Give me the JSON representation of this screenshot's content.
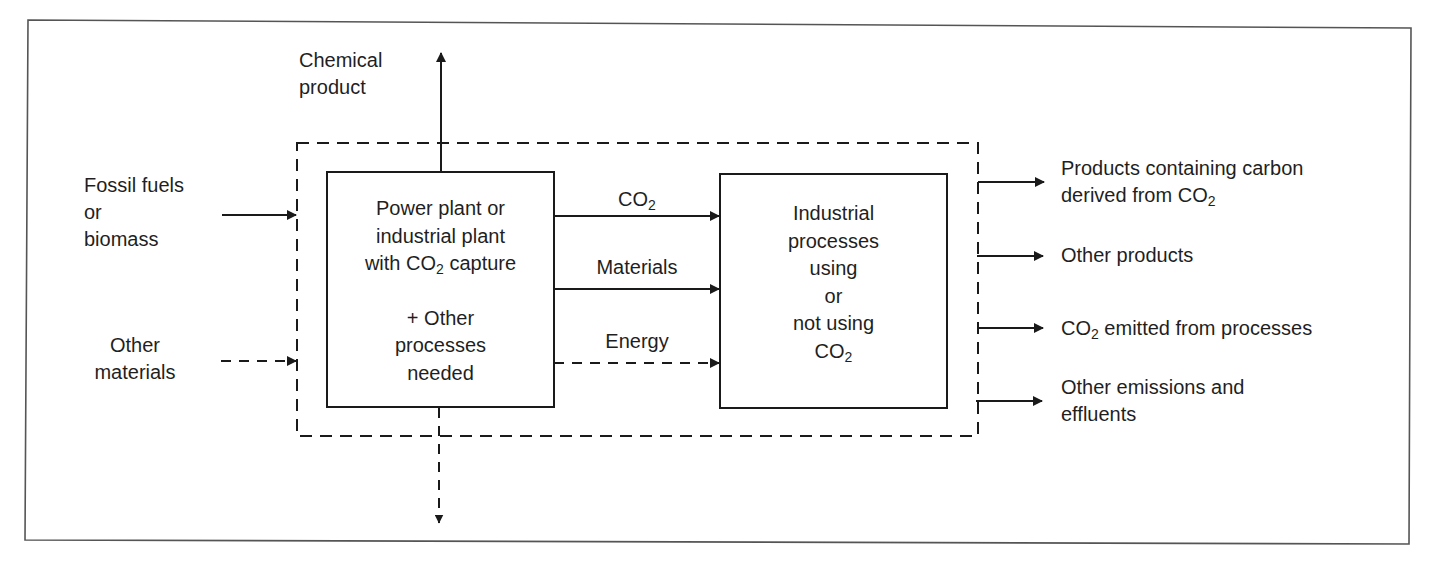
{
  "diagram": {
    "colors": {
      "stroke": "#1a1a1a",
      "frame": "#555555",
      "text": "#1f1f1f",
      "background": "#ffffff"
    },
    "inputs": {
      "fossil_fuels": [
        "Fossil fuels",
        "or",
        "biomass"
      ],
      "other_materials": [
        "Other",
        "materials"
      ]
    },
    "top_output": {
      "chemical_product": [
        "Chemical",
        "product"
      ]
    },
    "box_plant": {
      "line1": "Power plant or",
      "line2": "industrial plant",
      "line3_pre": "with CO",
      "line3_sub": "2",
      "line3_post": " capture",
      "line4": "+ Other",
      "line5": "processes",
      "line6": "needed"
    },
    "flows": {
      "co2_pre": "CO",
      "co2_sub": "2",
      "materials": "Materials",
      "energy": "Energy"
    },
    "box_industrial": {
      "line1": "Industrial",
      "line2": "processes",
      "line3": "using",
      "line4": "or",
      "line5": "not using",
      "line6_pre": "CO",
      "line6_sub": "2"
    },
    "outputs": {
      "products_carbon_line1": "Products containing carbon",
      "products_carbon_line2_pre": "derived from CO",
      "products_carbon_line2_sub": "2",
      "other_products": "Other products",
      "co2_emitted_pre": "CO",
      "co2_emitted_sub": "2",
      "co2_emitted_post": " emitted from processes",
      "other_emissions_line1": "Other emissions and",
      "other_emissions_line2": "effluents"
    }
  }
}
